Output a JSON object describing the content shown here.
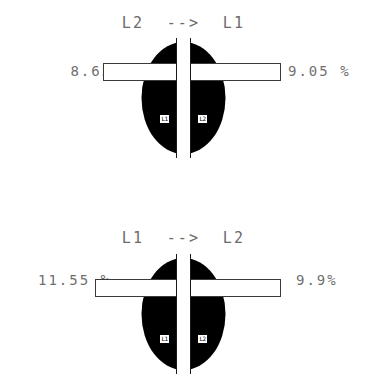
{
  "figures": [
    {
      "title": "L2  -->  L1",
      "left_value": "8.65 %",
      "right_value": "9.05 %",
      "left_node": "L1",
      "right_node": "L2"
    },
    {
      "title": "L1  -->  L2",
      "left_value": "11.55 %",
      "right_value": "9.9%",
      "left_node": "L1",
      "right_node": "L2"
    }
  ],
  "colors": {
    "body_fill": "#000000",
    "bar_fill": "#ffffff",
    "bar_stroke": "#3a3a3a",
    "text": "#6b6b6b",
    "background": "#ffffff"
  }
}
